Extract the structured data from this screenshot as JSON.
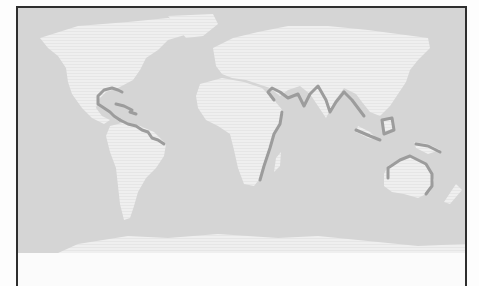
{
  "figure": {
    "type": "world-map",
    "projection": "equirectangular-like",
    "colors": {
      "ocean": "#d5d5d5",
      "land": "#efefef",
      "highlighted_coastline": "#9c9c9c",
      "frame": "#2e2e2e"
    },
    "highlighted_regions": [
      "Gulf of Mexico and Caribbean",
      "Northern South America coast",
      "East Africa coast",
      "Arabian Peninsula and South Asia coast",
      "Southeast Asia and Indonesia",
      "New Guinea",
      "Northern Australia"
    ]
  }
}
